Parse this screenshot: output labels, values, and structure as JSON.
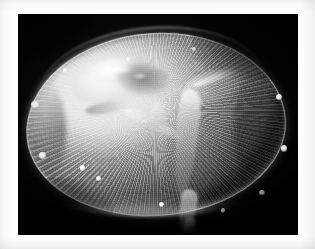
{
  "page": {
    "kind": "photograph",
    "orientation": "landscape",
    "color_mode": "grayscale",
    "margin_color": "#ffffff",
    "margin_tint_color": "#efefef"
  },
  "photo": {
    "caption": "",
    "subject": "jellyfish-medusa",
    "background_color": "#000000",
    "highlight_color": "#ffffff",
    "midtone_color": "#a8a8a6",
    "shadow_color": "#141414",
    "frame": {
      "left_px": 18,
      "top_px": 14,
      "width_px": 280,
      "height_px": 221
    },
    "features": [
      {
        "name": "bell",
        "label": "translucent bell (umbrella)"
      },
      {
        "name": "gonad-highlight",
        "label": "bright gonad and stomach mass"
      },
      {
        "name": "radial-canals",
        "label": "radial canals striating the bell"
      },
      {
        "name": "bell-rim",
        "label": "illuminated bell margin"
      },
      {
        "name": "oral-arm-main",
        "label": "trailing oral arm"
      },
      {
        "name": "oral-arm-upper",
        "label": "folded oral arm lappet"
      },
      {
        "name": "marginal-bulbs",
        "label": "bright marginal bulbs along the rim"
      },
      {
        "name": "tentacle-trail",
        "label": "trailing tentacle"
      }
    ],
    "bulb_count": 12
  }
}
